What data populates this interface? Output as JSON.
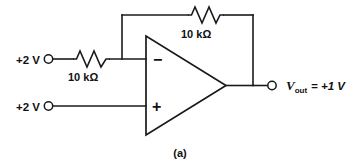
{
  "figure": {
    "caption": "(a)"
  },
  "sources": {
    "inverting_input_label": "+2 V",
    "noninverting_input_label": "+2 V"
  },
  "resistors": {
    "input_resistor_label": "10 kΩ",
    "feedback_resistor_label": "10 kΩ"
  },
  "opamp": {
    "inverting_sign": "−",
    "noninverting_sign": "+"
  },
  "output": {
    "symbol": "V",
    "subscript": "out",
    "equation": "= +1 V",
    "full_label": "Vout = +1 V"
  },
  "colors": {
    "line": "#1a1a1a",
    "text": "#111111",
    "background": "#ffffff"
  }
}
